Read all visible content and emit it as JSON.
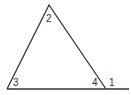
{
  "diagram": {
    "type": "triangle with exterior angle",
    "labels": {
      "apex": "2",
      "left": "3",
      "right_interior": "4",
      "exterior": "1"
    },
    "line_color": "#333333"
  }
}
